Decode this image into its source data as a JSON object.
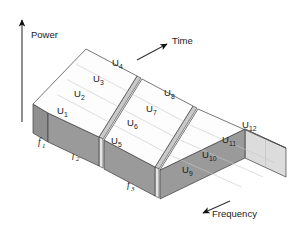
{
  "figure": {
    "background_color": "#ffffff",
    "axes": [
      {
        "id": "power",
        "label": "Power",
        "icon": "arrow-up-icon",
        "direction": "up"
      },
      {
        "id": "time",
        "label": "Time",
        "icon": "arrow-up-right-icon",
        "direction": "up-right"
      },
      {
        "id": "frequency",
        "label": "Frequency",
        "icon": "arrow-down-left-icon",
        "direction": "down-left"
      }
    ],
    "colors": {
      "outline": "#3c3c3c",
      "top_face": "#fdfdfd",
      "front_face": "#9a9a9a",
      "side_face": "#dcdcdc",
      "gap_face": "#c9c9c9",
      "grid_line": "#c8c8c8",
      "text": "#1a1a1a"
    },
    "slabs": [
      {
        "id": "slab-1",
        "frequency_label": "f",
        "frequency_sub": "1",
        "cells": [
          {
            "label": "U",
            "sub": "1"
          },
          {
            "label": "U",
            "sub": "2"
          },
          {
            "label": "U",
            "sub": "3"
          },
          {
            "label": "U",
            "sub": "4"
          }
        ]
      },
      {
        "id": "slab-2",
        "frequency_label": "f",
        "frequency_sub": "2",
        "cells": [
          {
            "label": "U",
            "sub": "5"
          },
          {
            "label": "U",
            "sub": "6"
          },
          {
            "label": "U",
            "sub": "7"
          },
          {
            "label": "U",
            "sub": "8"
          }
        ]
      },
      {
        "id": "slab-3",
        "frequency_label": "f",
        "frequency_sub": "3",
        "cells": [
          {
            "label": "U",
            "sub": "9"
          },
          {
            "label": "U",
            "sub": "10"
          },
          {
            "label": "U",
            "sub": "11"
          },
          {
            "label": "U",
            "sub": "12"
          }
        ]
      }
    ]
  }
}
